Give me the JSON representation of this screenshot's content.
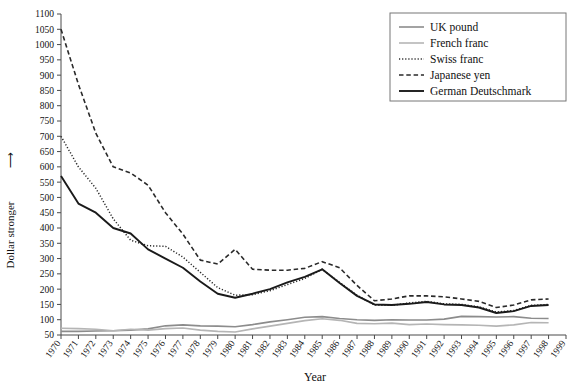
{
  "chart_data": {
    "type": "line",
    "title": "",
    "xlabel": "Year",
    "ylabel": "Dollar stronger",
    "ylabel_arrow": "⟶",
    "xlim": [
      1970,
      1999
    ],
    "ylim": [
      50,
      1100
    ],
    "ytick_step": 50,
    "grid": false,
    "legend_position": "top-right",
    "x": [
      1970,
      1971,
      1972,
      1973,
      1974,
      1975,
      1976,
      1977,
      1978,
      1979,
      1980,
      1981,
      1982,
      1983,
      1984,
      1985,
      1986,
      1987,
      1988,
      1989,
      1990,
      1991,
      1992,
      1993,
      1994,
      1995,
      1996,
      1997,
      1998
    ],
    "ytick_labels": [
      "50",
      "100",
      "150",
      "200",
      "250",
      "300",
      "350",
      "400",
      "450",
      "500",
      "550",
      "600",
      "650",
      "700",
      "750",
      "800",
      "850",
      "900",
      "950",
      "1000",
      "1050",
      "1100"
    ],
    "xtick_labels": [
      "1970",
      "1971",
      "1972",
      "1973",
      "1974",
      "1975",
      "1976",
      "1977",
      "1978",
      "1979",
      "1980",
      "1981",
      "1982",
      "1983",
      "1984",
      "1985",
      "1986",
      "1987",
      "1988",
      "1989",
      "1990",
      "1991",
      "1992",
      "1993",
      "1994",
      "1995",
      "1996",
      "1997",
      "1998",
      "1999"
    ],
    "series": [
      {
        "name": "UK pound",
        "color": "#8c8c8c",
        "style": "solid",
        "width": 1.6,
        "values": [
          62,
          62,
          63,
          64,
          66,
          70,
          80,
          83,
          80,
          79,
          77,
          84,
          93,
          100,
          108,
          110,
          104,
          100,
          98,
          100,
          99,
          99,
          102,
          111,
          110,
          109,
          110,
          105,
          104
        ]
      },
      {
        "name": "French franc",
        "color": "#b5b5b5",
        "style": "solid",
        "width": 1.6,
        "values": [
          72,
          71,
          69,
          64,
          69,
          66,
          71,
          73,
          66,
          62,
          60,
          70,
          79,
          88,
          97,
          103,
          98,
          88,
          87,
          89,
          84,
          86,
          84,
          83,
          82,
          79,
          83,
          91,
          90
        ]
      },
      {
        "name": "Swiss franc",
        "color": "#2a2a2a",
        "style": "dotted",
        "width": 1.5,
        "values": [
          700,
          600,
          530,
          430,
          360,
          342,
          340,
          305,
          255,
          205,
          180,
          182,
          195,
          215,
          235,
          265,
          222,
          180,
          148,
          147,
          155,
          160,
          152,
          150,
          142,
          125,
          130,
          147,
          150
        ]
      },
      {
        "name": "Japanese yen",
        "color": "#2a2a2a",
        "style": "dashed",
        "width": 1.6,
        "values": [
          1050,
          870,
          710,
          600,
          580,
          540,
          450,
          380,
          295,
          282,
          330,
          265,
          262,
          262,
          268,
          290,
          270,
          212,
          162,
          168,
          178,
          178,
          175,
          168,
          160,
          140,
          148,
          165,
          168
        ]
      },
      {
        "name": "German Deutschmark",
        "color": "#1a1a1a",
        "style": "solid",
        "width": 1.9,
        "values": [
          570,
          480,
          450,
          400,
          382,
          330,
          300,
          270,
          225,
          185,
          172,
          185,
          200,
          222,
          240,
          265,
          220,
          178,
          150,
          148,
          152,
          158,
          150,
          148,
          140,
          122,
          128,
          145,
          148
        ]
      }
    ]
  }
}
